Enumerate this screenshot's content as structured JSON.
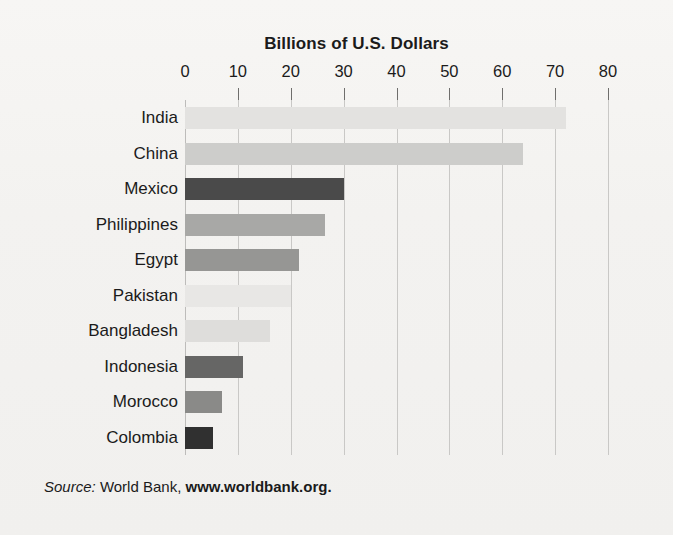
{
  "chart_data": {
    "type": "bar",
    "orientation": "horizontal",
    "title": "Billions of U.S. Dollars",
    "xlabel": "",
    "ylabel": "",
    "xlim": [
      0,
      80
    ],
    "xticks": [
      0,
      10,
      20,
      30,
      40,
      50,
      60,
      70,
      80
    ],
    "xtick_labels": [
      "0",
      "10",
      "20",
      "30",
      "40",
      "50",
      "60",
      "70",
      "80"
    ],
    "grid": true,
    "grid_axis": "x",
    "legend": "none",
    "categories": [
      "India",
      "China",
      "Mexico",
      "Philippines",
      "Egypt",
      "Pakistan",
      "Bangladesh",
      "Indonesia",
      "Morocco",
      "Colombia"
    ],
    "values": [
      72,
      64,
      30,
      26.5,
      21.5,
      20,
      16,
      11,
      7,
      5.3
    ],
    "bar_colors": [
      "#e3e2e0",
      "#cdcdcb",
      "#4a4a4a",
      "#a8a8a6",
      "#969694",
      "#e8e7e5",
      "#dedddb",
      "#666665",
      "#8a8a88",
      "#303030"
    ],
    "annotations": []
  },
  "source": {
    "label": "Source:",
    "publisher": "World Bank,",
    "url": "www.worldbank.org."
  },
  "colors": {
    "background": "#f4f3f1",
    "gridline": "#c9c8c6",
    "tick": "#6f6e6c",
    "text": "#1b1b1b"
  }
}
